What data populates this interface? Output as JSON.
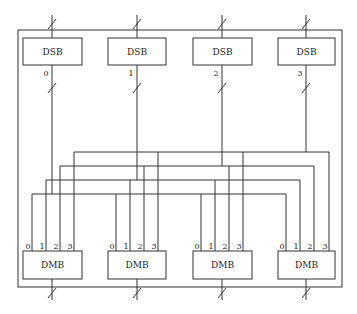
{
  "diagram": {
    "title": "",
    "frame": {
      "x": 18,
      "y": 30,
      "width": 324,
      "height": 257
    },
    "dsb": [
      {
        "label": "DSB",
        "index": "0",
        "x": 23,
        "y": 38,
        "width": 59,
        "height": 27,
        "port_x": 52
      },
      {
        "label": "DSB",
        "index": "1",
        "x": 108,
        "y": 38,
        "width": 58,
        "height": 27,
        "port_x": 137
      },
      {
        "label": "DSB",
        "index": "2",
        "x": 193,
        "y": 38,
        "width": 59,
        "height": 27,
        "port_x": 222
      },
      {
        "label": "DSB",
        "index": "3",
        "x": 278,
        "y": 38,
        "width": 57,
        "height": 27,
        "port_x": 306
      }
    ],
    "dmb": [
      {
        "label": "DMB",
        "x": 23,
        "y": 251,
        "width": 59,
        "height": 28,
        "port_x": 52,
        "inputs": [
          {
            "label": "0",
            "x": 32
          },
          {
            "label": "1",
            "x": 46
          },
          {
            "label": "2",
            "x": 60
          },
          {
            "label": "3",
            "x": 74
          }
        ]
      },
      {
        "label": "DMB",
        "x": 108,
        "y": 251,
        "width": 58,
        "height": 28,
        "port_x": 137,
        "inputs": [
          {
            "label": "0",
            "x": 116
          },
          {
            "label": "1",
            "x": 130
          },
          {
            "label": "2",
            "x": 144
          },
          {
            "label": "3",
            "x": 158
          }
        ]
      },
      {
        "label": "DMB",
        "x": 193,
        "y": 251,
        "width": 59,
        "height": 28,
        "port_x": 222,
        "inputs": [
          {
            "label": "0",
            "x": 201
          },
          {
            "label": "1",
            "x": 215
          },
          {
            "label": "2",
            "x": 229
          },
          {
            "label": "3",
            "x": 243
          }
        ]
      },
      {
        "label": "DMB",
        "x": 278,
        "y": 251,
        "width": 57,
        "height": 28,
        "port_x": 306,
        "inputs": [
          {
            "label": "0",
            "x": 286
          },
          {
            "label": "1",
            "x": 300
          },
          {
            "label": "2",
            "x": 314
          },
          {
            "label": "3",
            "x": 329
          }
        ]
      }
    ],
    "buses": [
      {
        "source_dsb": "0",
        "y": 194,
        "target_input": "0"
      },
      {
        "source_dsb": "1",
        "y": 180,
        "target_input": "1"
      },
      {
        "source_dsb": "2",
        "y": 166,
        "target_input": "2"
      },
      {
        "source_dsb": "3",
        "y": 152,
        "target_input": "3"
      }
    ],
    "colors": {
      "line": "#333333",
      "background": "#ffffff",
      "text": "#222222"
    }
  }
}
